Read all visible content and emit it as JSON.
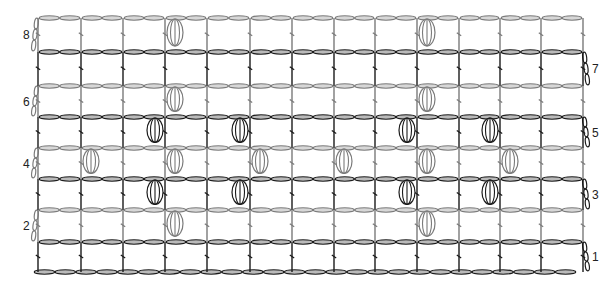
{
  "diagram": {
    "type": "crochet-stitch-chart",
    "width": 613,
    "height": 294,
    "colors": {
      "dark": "#1a1a1a",
      "gray": "#7a7a7a",
      "background": "#ffffff"
    },
    "posts_x": [
      38,
      81,
      123,
      165,
      207,
      250,
      292,
      334,
      375,
      417,
      459,
      500,
      541,
      583
    ],
    "foundation": {
      "y": 272,
      "x_start": 34,
      "x_end": 576,
      "chain_count": 26
    },
    "rows": [
      {
        "number": "1",
        "label": "1",
        "label_side": "right",
        "top_y": 242,
        "base_y": 272,
        "color": "dark",
        "bobble_cells": [],
        "bobble_align": "none"
      },
      {
        "number": "2",
        "label": "2",
        "label_side": "left",
        "top_y": 210,
        "base_y": 242,
        "color": "gray",
        "bobble_cells": [
          3,
          9
        ],
        "bobble_align": "right-of-post"
      },
      {
        "number": "3",
        "label": "3",
        "label_side": "right",
        "top_y": 179,
        "base_y": 210,
        "color": "dark",
        "bobble_cells": [
          2,
          4,
          8,
          10
        ],
        "bobble_align": "left-of-post"
      },
      {
        "number": "4",
        "label": "4",
        "label_side": "left",
        "top_y": 148,
        "base_y": 179,
        "color": "gray",
        "bobble_cells": [
          1,
          3,
          5,
          7,
          9,
          11
        ],
        "bobble_align": "right-of-post"
      },
      {
        "number": "5",
        "label": "5",
        "label_side": "right",
        "top_y": 117,
        "base_y": 148,
        "color": "dark",
        "bobble_cells": [
          2,
          4,
          8,
          10
        ],
        "bobble_align": "left-of-post"
      },
      {
        "number": "6",
        "label": "6",
        "label_side": "left",
        "top_y": 86,
        "base_y": 117,
        "color": "gray",
        "bobble_cells": [
          3,
          9
        ],
        "bobble_align": "right-of-post"
      },
      {
        "number": "7",
        "label": "7",
        "label_side": "right",
        "top_y": 52,
        "base_y": 86,
        "color": "dark",
        "bobble_cells": [],
        "bobble_align": "none"
      },
      {
        "number": "8",
        "label": "8",
        "label_side": "left",
        "top_y": 18,
        "base_y": 52,
        "color": "gray",
        "bobble_cells": [
          3,
          9
        ],
        "bobble_align": "right-of-post"
      }
    ],
    "legend_symbols": {
      "chain": "chain-stitch-oval",
      "post": "double-crochet-post",
      "bobble": "bobble-stitch",
      "turn": "turning-chain"
    }
  }
}
